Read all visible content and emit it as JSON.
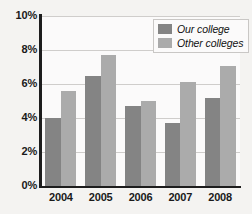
{
  "chart_data": {
    "type": "bar",
    "title": "",
    "xlabel": "",
    "ylabel": "",
    "categories": [
      "2004",
      "2005",
      "2006",
      "2007",
      "2008"
    ],
    "series": [
      {
        "name": "Our college",
        "color": "#848484",
        "values": [
          4.0,
          6.5,
          4.7,
          3.7,
          5.2
        ]
      },
      {
        "name": "Other colleges",
        "color": "#ababab",
        "values": [
          5.6,
          7.7,
          5.0,
          6.1,
          7.05
        ]
      }
    ],
    "ylim": [
      0,
      10
    ],
    "yticks": [
      "0%",
      "2%",
      "4%",
      "6%",
      "8%",
      "10%"
    ],
    "ytick_values": [
      0,
      2,
      4,
      6,
      8,
      10
    ],
    "grid": true,
    "legend_position": "top-right"
  },
  "legend": {
    "items": [
      {
        "label": "Our college"
      },
      {
        "label": "Other colleges"
      }
    ]
  }
}
